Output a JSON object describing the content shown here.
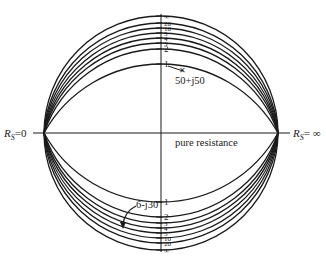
{
  "diagram": {
    "type": "resistance-circle-chart",
    "center": [
      161,
      133
    ],
    "radius": 117,
    "stroke_color": "#1a1a1a",
    "background": "#ffffff",
    "left_label": {
      "main": "R",
      "sub": "S",
      "rest": "=0"
    },
    "right_label": {
      "main": "R",
      "sub": "S",
      "rest": "= ∞"
    },
    "horizontal_axis_label": "pure resistance",
    "upper_scale": [
      {
        "label": "∞",
        "y": 16
      },
      {
        "label": "20",
        "y": 23
      },
      {
        "label": "10",
        "y": 28
      },
      {
        "label": "5",
        "y": 33
      },
      {
        "label": "4",
        "y": 38
      },
      {
        "label": "3",
        "y": 43
      },
      {
        "label": "2",
        "y": 49
      },
      {
        "label": "1",
        "y": 64
      }
    ],
    "lower_scale": [
      {
        "label": "1",
        "y": 202
      },
      {
        "label": "2",
        "y": 217
      },
      {
        "label": "3",
        "y": 223
      },
      {
        "label": "4",
        "y": 228
      },
      {
        "label": "5",
        "y": 233
      },
      {
        "label": "10",
        "y": 238
      },
      {
        "label": "20",
        "y": 243
      },
      {
        "label": "∞",
        "y": 250
      }
    ],
    "annotations": [
      {
        "label": "50+j50",
        "x": 175,
        "y": 84
      },
      {
        "label": "6-j30",
        "x": 136,
        "y": 208
      }
    ]
  }
}
